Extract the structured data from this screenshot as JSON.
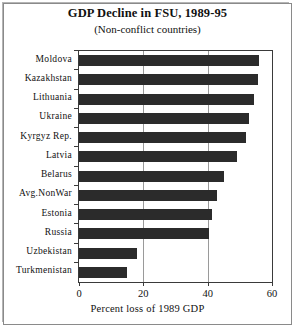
{
  "chart_data": {
    "type": "bar",
    "orientation": "horizontal",
    "title": "GDP Decline in FSU, 1989-95",
    "subtitle": "(Non-conflict countries)",
    "xlabel": "Percent loss of 1989 GDP",
    "ylabel": "",
    "xlim": [
      0,
      60
    ],
    "xticks": [
      0,
      20,
      40,
      60
    ],
    "xticklabels": [
      "0",
      "20",
      "40",
      "60"
    ],
    "grid": "vertical",
    "legend": "none",
    "bar_color": "#2b2b2b",
    "categories": [
      "Moldova",
      "Kazakhstan",
      "Lithuania",
      "Ukraine",
      "Kyrgyz Rep.",
      "Latvia",
      "Belarus",
      "Avg.NonWar",
      "Estonia",
      "Russia",
      "Uzbekistan",
      "Turkmenistan"
    ],
    "values": [
      56,
      55.5,
      54.5,
      53,
      52,
      49,
      45,
      43,
      41.5,
      40.5,
      18,
      15
    ]
  }
}
